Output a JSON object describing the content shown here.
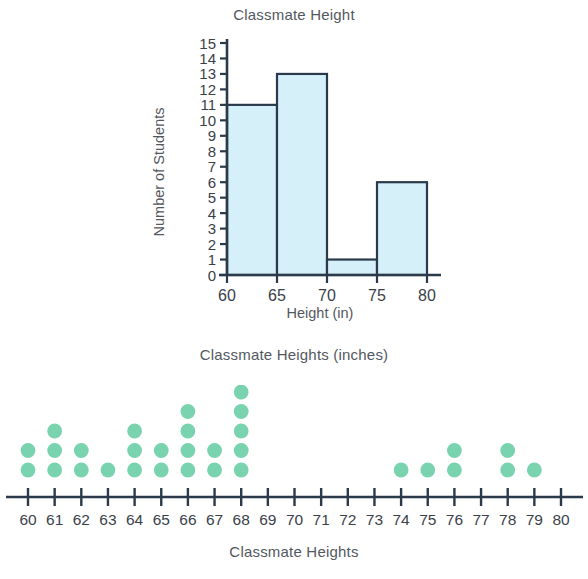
{
  "histogram": {
    "title": "Classmate Height",
    "ylabel": "Number of Students",
    "xlabel": "Height (in)",
    "bar_fill": "#d5f0f8",
    "bar_stroke": "#2b3a4a",
    "axis_color": "#2b3a4a"
  },
  "dotplot": {
    "title": "Classmate Heights (inches)",
    "caption": "Classmate Heights",
    "dot_color": "#79d3ae",
    "axis_color": "#2b3a4a"
  },
  "chart_data": [
    {
      "type": "bar",
      "title": "Classmate Height",
      "xlabel": "Height (in)",
      "ylabel": "Number of Students",
      "categories": [
        "60-65",
        "65-70",
        "70-75",
        "75-80"
      ],
      "bin_edges": [
        60,
        65,
        70,
        75,
        80
      ],
      "values": [
        11,
        13,
        1,
        6
      ],
      "xlim": [
        60,
        80
      ],
      "ylim": [
        0,
        15
      ],
      "xticks": [
        60,
        65,
        70,
        75,
        80
      ],
      "yticks": [
        0,
        1,
        2,
        3,
        4,
        5,
        6,
        7,
        8,
        9,
        10,
        11,
        12,
        13,
        14,
        15
      ],
      "grid": false,
      "legend": null
    },
    {
      "type": "scatter",
      "subtype": "dotplot",
      "title": "Classmate Heights (inches)",
      "caption": "Classmate Heights",
      "xlabel": "",
      "ylabel": "",
      "xlim": [
        60,
        80
      ],
      "xticks": [
        60,
        61,
        62,
        63,
        64,
        65,
        66,
        67,
        68,
        69,
        70,
        71,
        72,
        73,
        74,
        75,
        76,
        77,
        78,
        79,
        80
      ],
      "categories": [
        60,
        61,
        62,
        63,
        64,
        65,
        66,
        67,
        68,
        69,
        70,
        71,
        72,
        73,
        74,
        75,
        76,
        77,
        78,
        79,
        80
      ],
      "values": [
        2,
        3,
        2,
        1,
        3,
        2,
        4,
        2,
        5,
        0,
        0,
        0,
        0,
        0,
        1,
        1,
        2,
        0,
        2,
        1,
        0
      ],
      "total_dots": 31,
      "grid": false,
      "legend": null
    }
  ]
}
